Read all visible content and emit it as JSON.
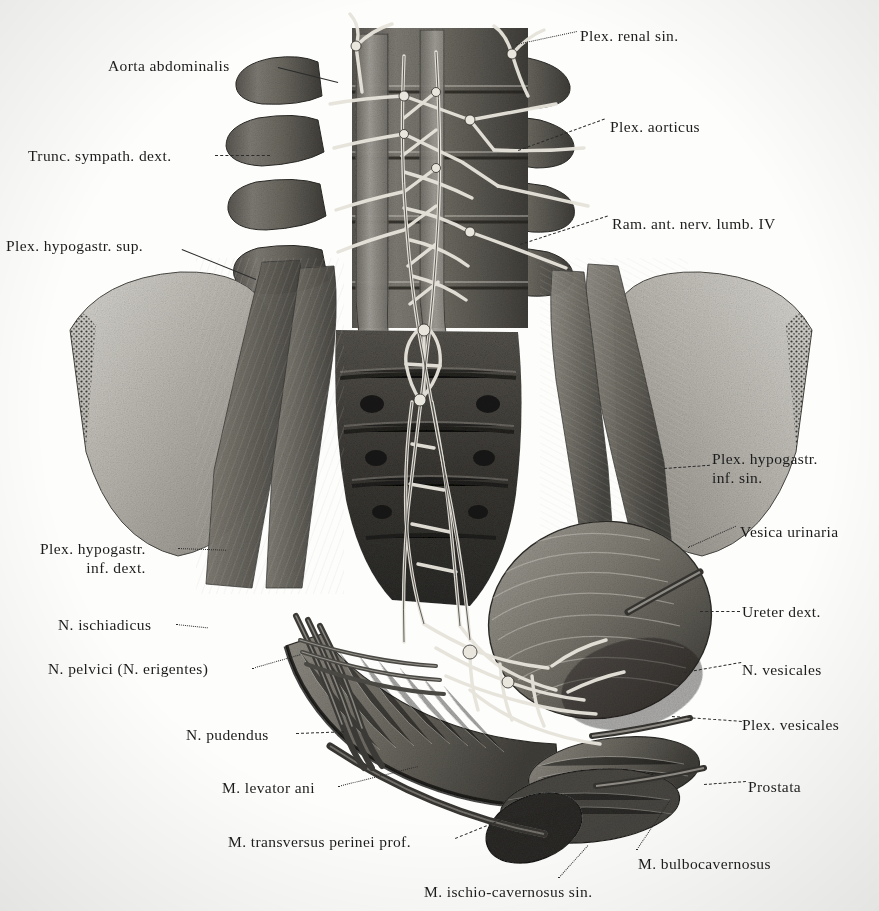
{
  "plate": {
    "kind": "anatomical-illustration",
    "subject": "Autonomic nerve plexuses of the male pelvis (anterior view)",
    "background_color": "#fdfdfb",
    "ink_color": "#1c1c1c",
    "leader_color": "#2b2b2b"
  },
  "labels": {
    "left": [
      {
        "id": "aorta-abdominalis",
        "text": "Aorta abdominalis",
        "x": 108,
        "y": 57,
        "lead": {
          "x": 278,
          "y": 67,
          "len": 62,
          "angle": 14,
          "style": "solid"
        }
      },
      {
        "id": "trunc-sympath-dext",
        "text": "Trunc. sympath. dext.",
        "x": 28,
        "y": 147,
        "lead": {
          "x": 215,
          "y": 155,
          "len": 55,
          "angle": 0,
          "style": "dash"
        }
      },
      {
        "id": "plex-hypogastr-sup",
        "text": "Plex. hypogastr. sup.",
        "x": 6,
        "y": 237,
        "lead": {
          "x": 182,
          "y": 249,
          "len": 80,
          "angle": 22,
          "style": "solid"
        }
      },
      {
        "id": "plex-hypogastr-inf-dext",
        "text": "Plex. hypogastr.\ninf. dext.",
        "x": 40,
        "y": 540,
        "lead": {
          "x": 178,
          "y": 548,
          "len": 48,
          "angle": 2,
          "style": "dot"
        }
      },
      {
        "id": "n-ischiadicus",
        "text": "N. ischiadicus",
        "x": 58,
        "y": 616,
        "lead": {
          "x": 176,
          "y": 624,
          "len": 32,
          "angle": 6,
          "style": "dot"
        }
      },
      {
        "id": "n-pelvici-erigentes",
        "text": "N. pelvici (N. erigentes)",
        "x": 48,
        "y": 660,
        "lead": {
          "x": 252,
          "y": 668,
          "len": 50,
          "angle": -16,
          "style": "dot"
        }
      },
      {
        "id": "n-pudendus",
        "text": "N. pudendus",
        "x": 186,
        "y": 726,
        "lead": {
          "x": 296,
          "y": 733,
          "len": 48,
          "angle": -2,
          "style": "dash"
        }
      },
      {
        "id": "m-levator-ani",
        "text": "M. levator ani",
        "x": 222,
        "y": 779,
        "lead": {
          "x": 338,
          "y": 786,
          "len": 82,
          "angle": -14,
          "style": "dot"
        }
      },
      {
        "id": "m-transversus-perinei",
        "text": "M. transversus perinei prof.",
        "x": 228,
        "y": 833,
        "lead": {
          "x": 455,
          "y": 838,
          "len": 70,
          "angle": -22,
          "style": "dash"
        }
      },
      {
        "id": "m-ischio-cavernosus-sin",
        "text": "M. ischio-cavernosus sin.",
        "x": 424,
        "y": 883,
        "lead": {
          "x": 558,
          "y": 878,
          "len": 44,
          "angle": -48,
          "style": "dot"
        }
      }
    ],
    "right": [
      {
        "id": "plex-renal-sin",
        "text": "Plex. renal sin.",
        "x": 580,
        "y": 27,
        "lead": {
          "x": 516,
          "y": 44,
          "len": 62,
          "angle": -12,
          "style": "dot"
        }
      },
      {
        "id": "plex-aorticus",
        "text": "Plex. aorticus",
        "x": 610,
        "y": 118,
        "lead": {
          "x": 518,
          "y": 150,
          "len": 92,
          "angle": -20,
          "style": "dash"
        }
      },
      {
        "id": "ram-ant-nerv-lumb-iv",
        "text": "Ram. ant. nerv. lumb. IV",
        "x": 612,
        "y": 215,
        "lead": {
          "x": 520,
          "y": 244,
          "len": 92,
          "angle": -18,
          "style": "dash"
        }
      },
      {
        "id": "plex-hypogastr-inf-sin",
        "text": "Plex. hypogastr.\ninf. sin.",
        "x": 712,
        "y": 450,
        "lead": {
          "x": 664,
          "y": 468,
          "len": 46,
          "angle": -4,
          "style": "dash"
        }
      },
      {
        "id": "vesica-urinaria",
        "text": "Vesica urinaria",
        "x": 740,
        "y": 523,
        "lead": {
          "x": 688,
          "y": 547,
          "len": 52,
          "angle": -24,
          "style": "dot"
        }
      },
      {
        "id": "ureter-dext",
        "text": "Ureter dext.",
        "x": 742,
        "y": 603,
        "lead": {
          "x": 700,
          "y": 611,
          "len": 40,
          "angle": 0,
          "style": "dash"
        }
      },
      {
        "id": "n-vesicales",
        "text": "N. vesicales",
        "x": 742,
        "y": 661,
        "lead": {
          "x": 684,
          "y": 672,
          "len": 58,
          "angle": -10,
          "style": "dash"
        }
      },
      {
        "id": "plex-vesicales",
        "text": "Plex. vesicales",
        "x": 742,
        "y": 716,
        "lead": {
          "x": 672,
          "y": 716,
          "len": 70,
          "angle": 4,
          "style": "dash"
        }
      },
      {
        "id": "prostata",
        "text": "Prostata",
        "x": 748,
        "y": 778,
        "lead": {
          "x": 704,
          "y": 784,
          "len": 42,
          "angle": -4,
          "style": "dash"
        }
      },
      {
        "id": "m-bulbocavernosus",
        "text": "M. bulbocavernosus",
        "x": 638,
        "y": 855,
        "lead": {
          "x": 636,
          "y": 850,
          "len": 60,
          "angle": -56,
          "style": "dot"
        }
      }
    ]
  }
}
